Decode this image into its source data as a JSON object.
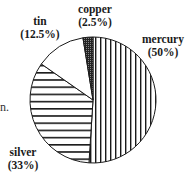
{
  "chart_data": {
    "type": "pie",
    "title": "",
    "categories": [
      "mercury",
      "silver",
      "tin",
      "copper"
    ],
    "values": [
      50,
      33,
      12.5,
      2.5
    ],
    "labels": [
      "mercury (50%)",
      "silver (33%)",
      "tin (12.5%)",
      "copper (2.5%)"
    ],
    "patterns": {
      "mercury": "vertical-stripes",
      "silver": "horizontal-stripes",
      "tin": "solid-white",
      "copper": "dense-dots-dark"
    },
    "start_angle": "12 o'clock, clockwise: mercury, silver, tin, copper",
    "legend": "none (direct labels)"
  },
  "labels": {
    "mercury": {
      "name": "mercury",
      "pct": "(50%)"
    },
    "silver": {
      "name": "silver",
      "pct": "(33%)"
    },
    "tin": {
      "name": "tin",
      "pct": "(12.5%)"
    },
    "copper": {
      "name": "copper",
      "pct": "(2.5%)"
    }
  },
  "fragment_text": "n."
}
